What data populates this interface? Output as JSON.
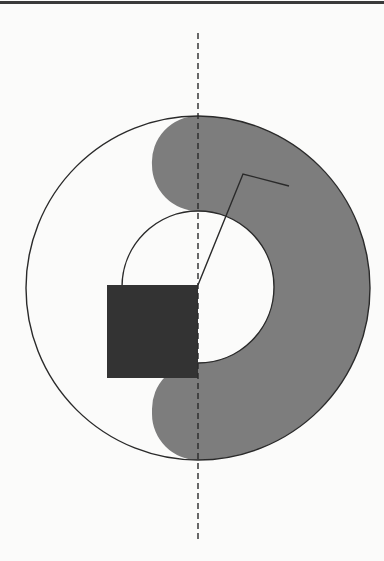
{
  "figure": {
    "colors": {
      "background": "#fbfbfa",
      "stroke": "#2a2a2a",
      "shaded_region": "#7d7d7d",
      "square": "#333333",
      "top_rule": "#3a3a3a"
    },
    "outer_circle": {
      "cx": 198,
      "cy": 288,
      "r": 172
    },
    "inner_circle": {
      "cx": 198,
      "cy": 287,
      "r": 76
    },
    "square": {
      "x": 107,
      "y": 285,
      "width": 91,
      "height": 93
    },
    "axis": {
      "x": 198,
      "y1": 33,
      "y2": 543
    },
    "polyline": "198,285 243,174 289,186"
  }
}
